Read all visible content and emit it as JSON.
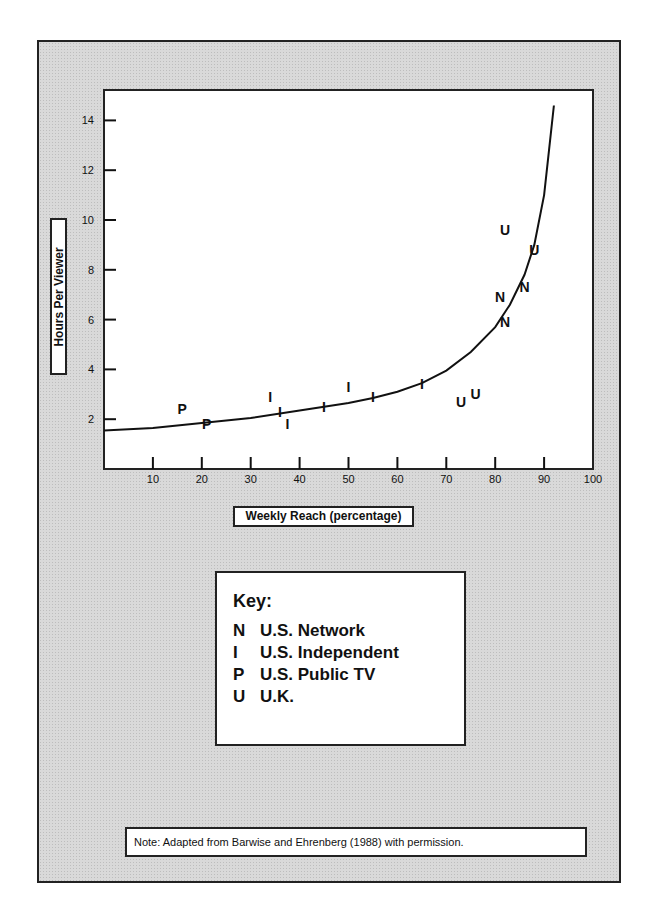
{
  "chart_data": {
    "type": "scatter",
    "title": "",
    "xlabel": "Weekly Reach (percentage)",
    "ylabel": "Hours Per Viewer",
    "xlim": [
      0,
      100
    ],
    "ylim": [
      0,
      15
    ],
    "x_ticks": [
      10,
      20,
      30,
      40,
      50,
      60,
      70,
      80,
      90,
      100
    ],
    "y_ticks": [
      2,
      4,
      6,
      8,
      10,
      12,
      14
    ],
    "grid": false,
    "legend_position": "below",
    "series": [
      {
        "name": "U.S. Network",
        "marker": "N",
        "points": [
          [
            81,
            6.9
          ],
          [
            82,
            5.9
          ],
          [
            86,
            7.3
          ]
        ]
      },
      {
        "name": "U.S. Independent",
        "marker": "I",
        "points": [
          [
            34,
            2.9
          ],
          [
            36,
            2.3
          ],
          [
            37.5,
            1.8
          ],
          [
            45,
            2.5
          ],
          [
            50,
            3.3
          ],
          [
            55,
            2.9
          ],
          [
            65,
            3.4
          ]
        ]
      },
      {
        "name": "U.S. Public TV",
        "marker": "P",
        "points": [
          [
            16,
            2.4
          ],
          [
            21,
            1.8
          ]
        ]
      },
      {
        "name": "U.K.",
        "marker": "U",
        "points": [
          [
            73,
            2.7
          ],
          [
            76,
            3.0
          ],
          [
            82,
            9.6
          ],
          [
            88,
            8.8
          ]
        ]
      }
    ],
    "fitted_curve": {
      "description": "Smooth curve rising sharply as reach approaches ~92%",
      "points": [
        [
          0,
          1.55
        ],
        [
          10,
          1.65
        ],
        [
          20,
          1.85
        ],
        [
          30,
          2.05
        ],
        [
          40,
          2.35
        ],
        [
          50,
          2.65
        ],
        [
          55,
          2.85
        ],
        [
          60,
          3.1
        ],
        [
          65,
          3.45
        ],
        [
          70,
          3.95
        ],
        [
          75,
          4.7
        ],
        [
          80,
          5.7
        ],
        [
          83,
          6.6
        ],
        [
          86,
          7.8
        ],
        [
          88,
          9.0
        ],
        [
          90,
          11.0
        ],
        [
          91,
          12.8
        ],
        [
          92,
          14.6
        ]
      ]
    },
    "annotations": [
      "Note: Adapted from Barwise and Ehrenberg (1988) with permission."
    ]
  },
  "axes": {
    "xlabel": "Weekly Reach (percentage)",
    "ylabel": "Hours Per Viewer"
  },
  "key": {
    "title": "Key:",
    "items": [
      {
        "symbol": "N",
        "label": "U.S. Network"
      },
      {
        "symbol": "I",
        "label": "U.S. Independent"
      },
      {
        "symbol": "P",
        "label": "U.S. Public TV"
      },
      {
        "symbol": "U",
        "label": "U.K."
      }
    ]
  },
  "note": "Note:  Adapted from Barwise and Ehrenberg (1988) with permission."
}
